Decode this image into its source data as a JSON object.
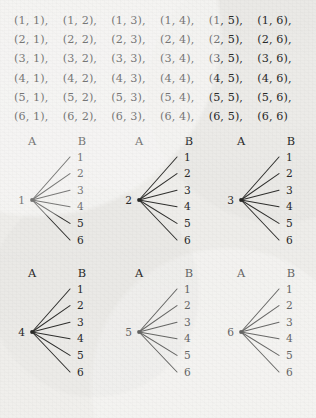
{
  "page": {
    "background_color": "#f1f0ed",
    "ink_color": "#2b2b2b"
  },
  "sample_space": {
    "name": "sample-space-pair-grid",
    "rows": [
      [
        "(1, 1),",
        "(1, 2),",
        "(1, 3),",
        "(1, 4),",
        "(1, 5),",
        "(1, 6),"
      ],
      [
        "(2, 1),",
        "(2, 2),",
        "(2, 3),",
        "(2, 4),",
        "(2, 5),",
        "(2, 6),"
      ],
      [
        "(3, 1),",
        "(3, 2),",
        "(3, 3),",
        "(3, 4),",
        "(3, 5),",
        "(3, 6),"
      ],
      [
        "(4, 1),",
        "(4, 2),",
        "(4, 3),",
        "(4, 4),",
        "(4, 5),",
        "(4, 6),"
      ],
      [
        "(5, 1),",
        "(5, 2),",
        "(5, 3),",
        "(5, 4),",
        "(5, 5),",
        "(5, 6),"
      ],
      [
        "(6, 1),",
        "(6, 2),",
        "(6, 3),",
        "(6, 4),",
        "(6, 5),",
        "(6, 6)"
      ]
    ]
  },
  "tree_headers": {
    "a": "A",
    "b": "B"
  },
  "tree_bands": [
    {
      "name": "tree-band-top",
      "trees": [
        {
          "root": "1",
          "leaves": [
            "1",
            "2",
            "3",
            "4",
            "5",
            "6"
          ]
        },
        {
          "root": "2",
          "leaves": [
            "1",
            "2",
            "3",
            "4",
            "5",
            "6"
          ]
        },
        {
          "root": "3",
          "leaves": [
            "1",
            "2",
            "3",
            "4",
            "5",
            "6"
          ]
        }
      ]
    },
    {
      "name": "tree-band-bottom",
      "trees": [
        {
          "root": "4",
          "leaves": [
            "1",
            "2",
            "3",
            "4",
            "5",
            "6"
          ]
        },
        {
          "root": "5",
          "leaves": [
            "1",
            "2",
            "3",
            "4",
            "5",
            "6"
          ]
        },
        {
          "root": "6",
          "leaves": [
            "1",
            "2",
            "3",
            "4",
            "5",
            "6"
          ]
        }
      ]
    }
  ]
}
